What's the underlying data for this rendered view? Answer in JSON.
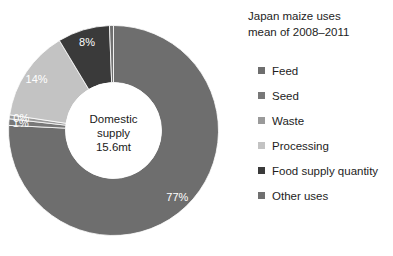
{
  "chart_data": {
    "type": "pie",
    "variant": "donut",
    "title": "Japan maize uses mean of 2008–2011",
    "title_lines": [
      "Japan maize uses",
      "mean of 2008–2011"
    ],
    "categories": [
      "Feed",
      "Seed",
      "Waste",
      "Processing",
      "Food supply quantity",
      "Other uses"
    ],
    "values": [
      77,
      1,
      0,
      14,
      8,
      0
    ],
    "labels": [
      "77%",
      "1%",
      "0%",
      "14%",
      "8%",
      ""
    ],
    "colors": [
      "#6e6e6e",
      "#787878",
      "#9a9a9a",
      "#c3c3c3",
      "#3a3a3a",
      "#707070"
    ],
    "series": [
      {
        "name": "Feed",
        "value": 77,
        "label": "77%",
        "color": "#6e6e6e"
      },
      {
        "name": "Seed",
        "value": 1,
        "label": "1%",
        "color": "#787878"
      },
      {
        "name": "Waste",
        "value": 0,
        "label": "0%",
        "color": "#9a9a9a"
      },
      {
        "name": "Processing",
        "value": 14,
        "label": "14%",
        "color": "#c3c3c3"
      },
      {
        "name": "Food supply quantity",
        "value": 8,
        "label": "8%",
        "color": "#3a3a3a"
      },
      {
        "name": "Other uses",
        "value": 0,
        "label": "",
        "color": "#707070"
      }
    ],
    "center_label_lines": [
      "Domestic",
      "supply",
      "15.6mt"
    ],
    "center_label": "Domestic supply 15.6mt",
    "units": "percent",
    "start_angle": 0,
    "direction": "clockwise",
    "legend_position": "right",
    "grid": false,
    "xlabel": "",
    "ylabel": ""
  },
  "title": {
    "line1": "Japan maize uses",
    "line2": "mean of 2008–2011"
  },
  "center": {
    "line1": "Domestic",
    "line2": "supply",
    "line3": "15.6mt"
  },
  "slice_labels": {
    "feed": "77%",
    "seed": "1%",
    "waste": "0%",
    "processing": "14%",
    "food_supply_quantity": "8%"
  },
  "legend": {
    "items": [
      {
        "label": "Feed",
        "color": "#6e6e6e"
      },
      {
        "label": "Seed",
        "color": "#787878"
      },
      {
        "label": "Waste",
        "color": "#9a9a9a"
      },
      {
        "label": "Processing",
        "color": "#c3c3c3"
      },
      {
        "label": "Food supply quantity",
        "color": "#3a3a3a"
      },
      {
        "label": "Other uses",
        "color": "#707070"
      }
    ]
  }
}
